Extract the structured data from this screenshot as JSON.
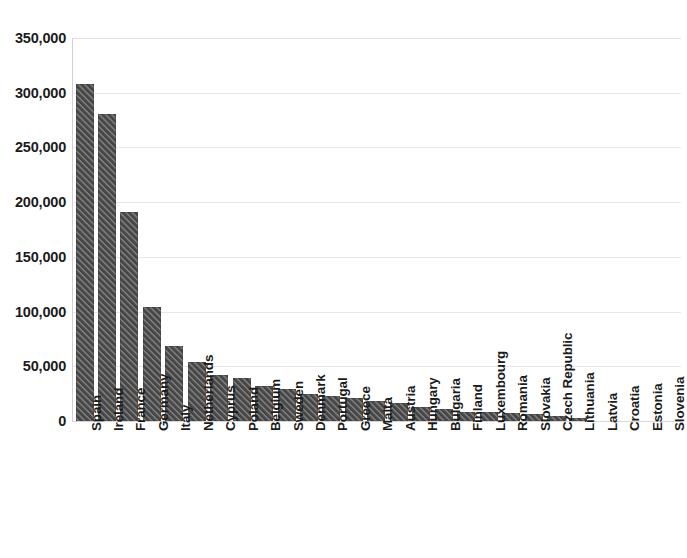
{
  "chart_data": {
    "type": "bar",
    "title": "",
    "subtitle": "",
    "xlabel": "",
    "ylabel": "",
    "ylim": [
      0,
      350000
    ],
    "ytick_values": [
      0,
      50000,
      100000,
      150000,
      200000,
      250000,
      300000,
      350000
    ],
    "ytick_labels": [
      "0",
      "50,000",
      "100,000",
      "150,000",
      "200,000",
      "250,000",
      "300,000",
      "350,000"
    ],
    "grid": "horizontal",
    "legend": "none",
    "bar_color": "#4c4c4c",
    "bar_pattern": "diagonal-hatch",
    "categories": [
      "Spain",
      "Ireland",
      "France",
      "Germany",
      "Italy",
      "Netherlands",
      "Cyprus",
      "Poland",
      "Belgium",
      "Sweden",
      "Denmark",
      "Portugal",
      "Greece",
      "Malta",
      "Austria",
      "Hungary",
      "Bulgaria",
      "Finland",
      "Luxembourg",
      "Romania",
      "Slovakia",
      "Czech Republic",
      "Lithuania",
      "Latvia",
      "Croatia",
      "Estonia",
      "Slovenia"
    ],
    "values": [
      308000,
      281000,
      191000,
      104000,
      68500,
      54000,
      42000,
      39000,
      32000,
      29000,
      25000,
      22500,
      21000,
      18000,
      16500,
      13000,
      11000,
      8500,
      8000,
      7500,
      6000,
      5000,
      2500,
      600,
      400,
      300,
      200
    ]
  }
}
